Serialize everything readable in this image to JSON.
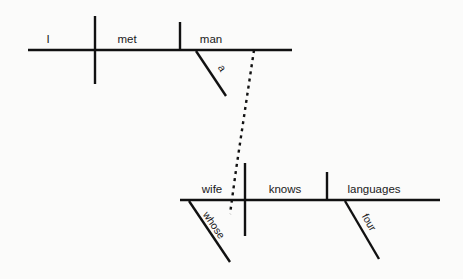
{
  "diagram": {
    "type": "reed-kellogg-sentence-diagram",
    "sentence": "I met a man whose wife knows four languages",
    "background_color": "#fbfbfa",
    "line_color": "#111111",
    "text_color": "#1a1a1a",
    "clauses": [
      {
        "name": "main-clause",
        "baseline": {
          "x1": 28,
          "y1": 50,
          "x2": 292,
          "y2": 50
        },
        "dividers": [
          {
            "name": "subject-verb-divider",
            "x": 95,
            "y1": 16,
            "y2": 84,
            "style": "full-cross"
          },
          {
            "name": "verb-object-divider",
            "x": 180,
            "y1": 22,
            "y2": 50,
            "style": "half-above"
          }
        ],
        "words": [
          {
            "name": "subject",
            "text": "I",
            "x": 48,
            "y": 43,
            "role": "subject"
          },
          {
            "name": "verb",
            "text": "met",
            "x": 113,
            "y": 43,
            "role": "verb"
          },
          {
            "name": "direct-object",
            "text": "man",
            "x": 196,
            "y": 43,
            "role": "direct-object"
          }
        ],
        "modifiers": [
          {
            "name": "article-a",
            "text": "a",
            "line": {
              "x1": 196,
              "y1": 51,
              "x2": 226,
              "y2": 96
            },
            "label_x": 216,
            "label_y": 68,
            "rotation": 57,
            "attaches_to": "man"
          }
        ]
      },
      {
        "name": "relative-clause",
        "baseline": {
          "x1": 180,
          "y1": 200,
          "x2": 440,
          "y2": 200
        },
        "dividers": [
          {
            "name": "subject-verb-divider",
            "x": 245,
            "y1": 163,
            "y2": 236,
            "style": "full-cross"
          },
          {
            "name": "verb-object-divider",
            "x": 327,
            "y1": 172,
            "y2": 200,
            "style": "half-above"
          }
        ],
        "words": [
          {
            "name": "subject",
            "text": "wife",
            "x": 200,
            "y": 193,
            "role": "subject"
          },
          {
            "name": "verb",
            "text": "knows",
            "x": 263,
            "y": 193,
            "role": "verb"
          },
          {
            "name": "direct-object",
            "text": "languages",
            "x": 341,
            "y": 193,
            "role": "direct-object"
          }
        ],
        "modifiers": [
          {
            "name": "possessive-whose",
            "text": "whose",
            "line": {
              "x1": 189,
              "y1": 201,
              "x2": 230,
              "y2": 262
            },
            "label_x": 203,
            "label_y": 218,
            "rotation": 56,
            "attaches_to": "wife"
          },
          {
            "name": "numeral-four",
            "text": "four",
            "line": {
              "x1": 345,
              "y1": 201,
              "x2": 379,
              "y2": 259
            },
            "label_x": 364,
            "label_y": 222,
            "rotation": 60,
            "attaches_to": "languages"
          }
        ]
      }
    ],
    "connector": {
      "name": "relative-pronoun-connector",
      "style": "dotted",
      "points": "254,50 248,90 242,130 236,170 230,214",
      "from": "man",
      "to": "whose"
    }
  }
}
